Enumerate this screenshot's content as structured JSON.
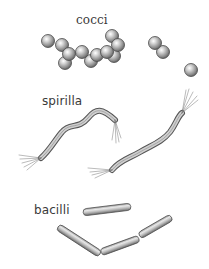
{
  "illustration": {
    "groups": [
      {
        "id": "cocci",
        "label": "cocci"
      },
      {
        "id": "spirilla",
        "label": "spirilla"
      },
      {
        "id": "bacilli",
        "label": "bacilli"
      }
    ]
  }
}
